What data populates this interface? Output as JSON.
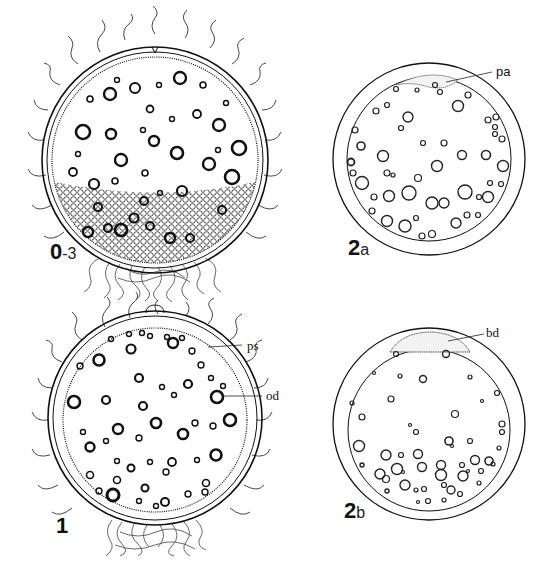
{
  "figure": {
    "panels": [
      {
        "id": "0-3",
        "stage_number": "0",
        "stage_suffix": "-3",
        "description": "Egg with hair-like filaments on chorion, yolk globules, dense granular yolk at bottom, tuft of filaments below",
        "annotations": []
      },
      {
        "id": "2a",
        "stage_number": "2",
        "stage_suffix": "a",
        "description": "Egg with smooth chorion, oil droplets scattered, thin cap at animal pole",
        "annotations": [
          {
            "label": "pa"
          }
        ]
      },
      {
        "id": "1",
        "stage_number": "1",
        "stage_suffix": "",
        "description": "Egg with filaments, oil droplets, perivitelline space",
        "annotations": [
          {
            "label": "ps"
          },
          {
            "label": "od"
          }
        ]
      },
      {
        "id": "2b",
        "stage_number": "2",
        "stage_suffix": "b",
        "description": "Egg with blastodisc at animal pole, oil droplets concentrated at vegetal half",
        "annotations": [
          {
            "label": "bd"
          }
        ]
      }
    ]
  },
  "colors": {
    "ink": "#111111",
    "background": "#ffffff"
  }
}
